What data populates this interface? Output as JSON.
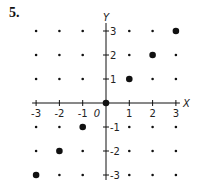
{
  "problem_number": "5.",
  "chart_data": {
    "type": "scatter",
    "title": "",
    "xlabel": "X",
    "ylabel": "Y",
    "origin_label": "0",
    "xlim": [
      -3,
      3
    ],
    "ylim": [
      -3,
      3
    ],
    "x_ticks": [
      -3,
      -2,
      -1,
      1,
      2,
      3
    ],
    "y_ticks": [
      -3,
      -2,
      -1,
      1,
      2,
      3
    ],
    "x_tick_labels": [
      "-3",
      "-2",
      "-1",
      "1",
      "2",
      "3"
    ],
    "y_tick_labels": [
      "-3",
      "-2",
      "-1",
      "1",
      "2",
      "3"
    ],
    "grid": "integer lattice dots",
    "lattice_points": "all integer (x, y) with -3 <= x, y <= 3",
    "highlighted_points": [
      {
        "x": -3,
        "y": -3
      },
      {
        "x": -2,
        "y": -2
      },
      {
        "x": -1,
        "y": -1
      },
      {
        "x": 0,
        "y": 0
      },
      {
        "x": 1,
        "y": 1
      },
      {
        "x": 2,
        "y": 2
      },
      {
        "x": 3,
        "y": 3
      }
    ],
    "legend": null
  },
  "colors": {
    "ink": "#111111",
    "background": "#ffffff"
  }
}
